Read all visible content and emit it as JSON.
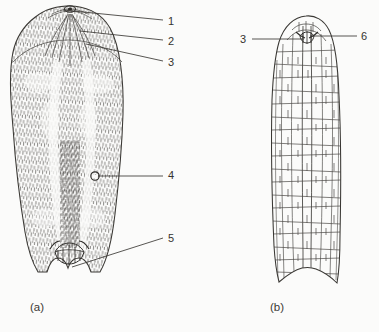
{
  "figure": {
    "kind": "scientific-line-drawing",
    "background_color": "#fbfbfa",
    "ink_color": "#3a3834",
    "width": 379,
    "height": 332,
    "panels": [
      {
        "id": "a",
        "caption": "(a)",
        "caption_x": 30,
        "caption_y": 302,
        "description": "whole-mount outline with dense stippled internal texture, rounded apical head, broad body, and W-shaped posterior notch"
      },
      {
        "id": "b",
        "caption": "(b)",
        "caption_x": 270,
        "caption_y": 302,
        "description": "elongated outline with reticulate cellular pattern, rounded apex, and curved posterior notch"
      }
    ]
  },
  "callouts": [
    {
      "id": "1",
      "label": "1",
      "label_x": 168,
      "label_y": 16,
      "panel": "a",
      "leader": {
        "x1": 63,
        "y1": 10,
        "x2": 163,
        "y2": 20
      }
    },
    {
      "id": "2",
      "label": "2",
      "label_x": 168,
      "label_y": 36,
      "panel": "a",
      "leader": {
        "x1": 80,
        "y1": 31,
        "x2": 163,
        "y2": 40
      }
    },
    {
      "id": "3",
      "label": "3",
      "label_x": 168,
      "label_y": 57,
      "panel": "a",
      "leader": {
        "x1": 86,
        "y1": 44,
        "x2": 163,
        "y2": 61
      }
    },
    {
      "id": "4",
      "label": "4",
      "label_x": 168,
      "label_y": 170,
      "panel": "a",
      "leader": {
        "x1": 98,
        "y1": 176,
        "x2": 163,
        "y2": 176
      }
    },
    {
      "id": "5",
      "label": "5",
      "label_x": 168,
      "label_y": 233,
      "panel": "a",
      "leader": {
        "x1": 72,
        "y1": 267,
        "x2": 163,
        "y2": 238
      }
    },
    {
      "id": "3b",
      "label": "3",
      "label_x": 240,
      "label_y": 34,
      "panel": "b",
      "leader": {
        "x1": 252,
        "y1": 39,
        "x2": 304,
        "y2": 39
      }
    },
    {
      "id": "6",
      "label": "6",
      "label_x": 361,
      "label_y": 31,
      "panel": "b",
      "leader": {
        "x1": 310,
        "y1": 36,
        "x2": 357,
        "y2": 36
      }
    }
  ]
}
